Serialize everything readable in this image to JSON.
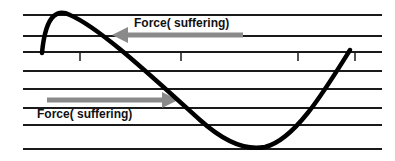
{
  "diagram": {
    "labels": {
      "top_arrow": "Force( suffering)",
      "bottom_arrow": "Force( suffering)"
    },
    "colors": {
      "lines": "#1a1a1a",
      "curve": "#000000",
      "arrow": "#8a8a8a",
      "text": "#111111"
    },
    "horizontal_lines_y": [
      15,
      36,
      52,
      71,
      89,
      108,
      125,
      149
    ],
    "tick_marks_x": [
      80,
      181,
      298,
      355
    ]
  }
}
